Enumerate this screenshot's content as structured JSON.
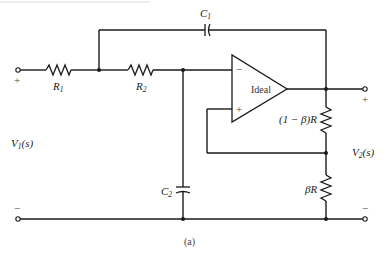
{
  "figure": {
    "type": "circuit-schematic",
    "caption": "(a)"
  },
  "components": {
    "R1": {
      "name": "R",
      "sub": "1"
    },
    "R2": {
      "name": "R",
      "sub": "2"
    },
    "C1": {
      "name": "C",
      "sub": "1"
    },
    "C2": {
      "name": "C",
      "sub": "2"
    },
    "R_top": {
      "label": "(1 − β)R"
    },
    "R_bottom": {
      "label": "βR"
    },
    "opamp": {
      "label": "Ideal",
      "inv_sign": "−",
      "noninv_sign": "+"
    }
  },
  "ports": {
    "input": {
      "name": "V",
      "sub": "1",
      "arg": "(s)",
      "plus": "+",
      "minus": "−"
    },
    "output": {
      "name": "V",
      "sub": "2",
      "arg": "(s)",
      "plus": "+",
      "minus": "−"
    }
  },
  "colors": {
    "ink": "#1a1a1a",
    "background": "#ffffff"
  }
}
